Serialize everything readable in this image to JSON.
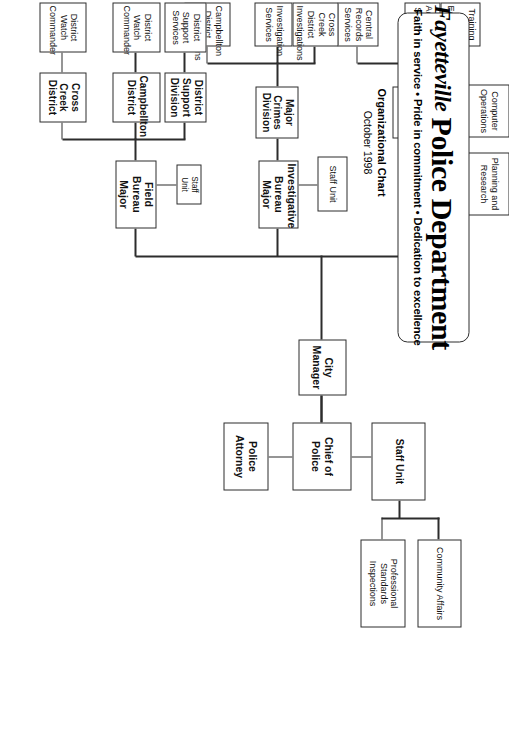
{
  "document": {
    "logo_word": "Fayetteville",
    "department_name": "Police Department",
    "tagline": "Faith in service • Pride in commitment • Dedication to excellence",
    "subtitle_line1": "Organizational Chart",
    "subtitle_line2": "October 1998"
  },
  "colors": {
    "line": "#2c2c2c",
    "box_fill": "#ffffff",
    "text": "#111111",
    "page": "#ffffff"
  },
  "chart_data": {
    "type": "diagram",
    "subtitle": "October 1998",
    "nodes": [
      {
        "id": "city_manager",
        "label": "City\nManager",
        "level": "executive",
        "bold": true
      },
      {
        "id": "chief",
        "label": "Chief of Police",
        "level": "executive",
        "bold": true
      },
      {
        "id": "police_attorney",
        "label": "Police Attorney",
        "level": "executive",
        "bold": true
      },
      {
        "id": "chief_staff",
        "label": "Staff Unit",
        "level": "staff",
        "bold": true
      },
      {
        "id": "community_affairs",
        "label": "Community Affairs",
        "level": "unit",
        "bold": false
      },
      {
        "id": "psi",
        "label": "Professional\nStandards\nInspections",
        "level": "unit",
        "bold": false
      },
      {
        "id": "service_major",
        "label": "Service Bureau\nMajor",
        "level": "bureau",
        "bold": true
      },
      {
        "id": "planning",
        "label": "Planning and\nResearch",
        "level": "unit",
        "bold": false
      },
      {
        "id": "tech_div",
        "label": "Technical\nServices\nDivision",
        "level": "division",
        "bold": true
      },
      {
        "id": "computer_ops",
        "label": "Computer\nOperations",
        "level": "unit",
        "bold": false
      },
      {
        "id": "training",
        "label": "Training\nand\nEducation",
        "level": "unit",
        "bold": false
      },
      {
        "id": "admin_svcs",
        "label": "Administrative\nServices",
        "level": "unit",
        "bold": false
      },
      {
        "id": "central_records",
        "label": "Central\nRecords\nServices",
        "level": "unit",
        "bold": false
      },
      {
        "id": "invest_major",
        "label": "Investigative\nBureau Major",
        "level": "bureau",
        "bold": true
      },
      {
        "id": "invest_staff",
        "label": "Staff Unit",
        "level": "staff",
        "bold": false
      },
      {
        "id": "major_crimes",
        "label": "Major Crimes\nDivision",
        "level": "division",
        "bold": true
      },
      {
        "id": "cross_creek_inv",
        "label": "Cross Creek\nDistrict\nInvestigations",
        "level": "unit",
        "bold": false
      },
      {
        "id": "invest_svcs",
        "label": "Investigation\nServices",
        "level": "unit",
        "bold": false
      },
      {
        "id": "campbellton_inv",
        "label": "Campbellton\nDistrict\nInvestigations",
        "level": "unit",
        "bold": false
      },
      {
        "id": "field_major",
        "label": "Field\nBureau\nMajor",
        "level": "bureau",
        "bold": true
      },
      {
        "id": "field_staff",
        "label": "Staff\nUnit",
        "level": "staff",
        "bold": false
      },
      {
        "id": "dist_support_div",
        "label": "District\nSupport\nDivision",
        "level": "division",
        "bold": true
      },
      {
        "id": "dist_support_svcs",
        "label": "District\nSupport\nServices",
        "level": "unit",
        "bold": false
      },
      {
        "id": "campbellton_dist",
        "label": "Campbellton\nDistrict",
        "level": "division",
        "bold": true
      },
      {
        "id": "campbellton_watch",
        "label": "District\nWatch\nCommander",
        "level": "unit",
        "bold": false
      },
      {
        "id": "cross_creek_dist",
        "label": "Cross\nCreek\nDistrict",
        "level": "division",
        "bold": true
      },
      {
        "id": "cross_creek_watch",
        "label": "District\nWatch\nCommander",
        "level": "unit",
        "bold": false
      }
    ],
    "edges": [
      [
        "city_manager",
        "chief"
      ],
      [
        "chief",
        "police_attorney"
      ],
      [
        "chief",
        "chief_staff"
      ],
      [
        "chief_staff",
        "community_affairs"
      ],
      [
        "chief_staff",
        "psi"
      ],
      [
        "chief",
        "service_major"
      ],
      [
        "chief",
        "invest_major"
      ],
      [
        "chief",
        "field_major"
      ],
      [
        "service_major",
        "planning"
      ],
      [
        "service_major",
        "tech_div"
      ],
      [
        "tech_div",
        "computer_ops"
      ],
      [
        "tech_div",
        "training"
      ],
      [
        "tech_div",
        "admin_svcs"
      ],
      [
        "tech_div",
        "central_records"
      ],
      [
        "invest_major",
        "invest_staff"
      ],
      [
        "invest_major",
        "major_crimes"
      ],
      [
        "major_crimes",
        "cross_creek_inv"
      ],
      [
        "major_crimes",
        "invest_svcs"
      ],
      [
        "major_crimes",
        "campbellton_inv"
      ],
      [
        "field_major",
        "field_staff"
      ],
      [
        "field_major",
        "dist_support_div"
      ],
      [
        "field_major",
        "campbellton_dist"
      ],
      [
        "field_major",
        "cross_creek_dist"
      ],
      [
        "dist_support_div",
        "dist_support_svcs"
      ],
      [
        "campbellton_dist",
        "campbellton_watch"
      ],
      [
        "cross_creek_dist",
        "cross_creek_watch"
      ]
    ]
  },
  "boxes": {
    "city_manager": "City\nManager",
    "chief": "Chief of Police",
    "police_attorney": "Police Attorney",
    "chief_staff": "Staff Unit",
    "community_affairs": "Community Affairs",
    "psi": "Professional\nStandards\nInspections",
    "service_major": "Service Bureau\nMajor",
    "planning": "Planning and\nResearch",
    "tech_div": "Technical\nServices\nDivision",
    "computer_ops": "Computer\nOperations",
    "training": "Training\nand\nEducation",
    "admin_svcs": "Administrative\nServices",
    "central_records": "Central\nRecords\nServices",
    "invest_major": "Investigative\nBureau Major",
    "invest_staff": "Staff Unit",
    "major_crimes": "Major Crimes\nDivision",
    "cross_creek_inv": "Cross Creek\nDistrict\nInvestigations",
    "invest_svcs": "Investigation\nServices",
    "campbellton_inv": "Campbellton\nDistrict\nInvestigations",
    "field_major": "Field\nBureau\nMajor",
    "field_staff": "Staff\nUnit",
    "dist_support_div": "District\nSupport\nDivision",
    "dist_support_svcs": "District\nSupport\nServices",
    "campbellton_dist": "Campbellton\nDistrict",
    "campbellton_watch": "District\nWatch\nCommander",
    "cross_creek_dist": "Cross\nCreek\nDistrict",
    "cross_creek_watch": "District\nWatch\nCommander"
  }
}
